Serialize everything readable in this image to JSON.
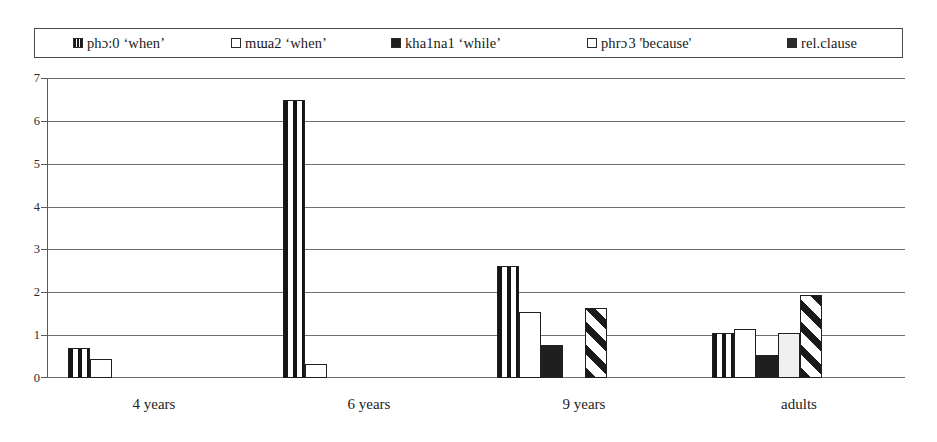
{
  "legend": {
    "items": [
      {
        "label": "phɔ:0  ‘when’",
        "swatch": "vertical-stripe-swatch",
        "style": "sw-vstripe"
      },
      {
        "label": "mɯa2 ‘when’",
        "swatch": "white-square-swatch",
        "style": "sw-white"
      },
      {
        "label": "kha1na1 ‘while’",
        "swatch": "black-square-swatch",
        "style": "sw-black"
      },
      {
        "label": "phrɔ 3 'because'",
        "swatch": "light-square-swatch",
        "style": "sw-lgray"
      },
      {
        "label": "rel.clause",
        "swatch": "dark-square-swatch",
        "style": "sw-dark"
      }
    ]
  },
  "axis": {
    "y_ticks": [
      "0",
      "1",
      "2",
      "3",
      "4",
      "5",
      "6",
      "7"
    ],
    "x_labels": [
      "4 years",
      "6 years",
      "9 years",
      "adults"
    ]
  },
  "chart_data": {
    "type": "bar",
    "title": "",
    "xlabel": "",
    "ylabel": "",
    "ylim": [
      0,
      7
    ],
    "grid": true,
    "legend_position": "top",
    "categories": [
      "4 years",
      "6 years",
      "9 years",
      "adults"
    ],
    "series": [
      {
        "name": "phɔ:0  ‘when’",
        "fill": "vertical-stripe",
        "values": [
          0.7,
          6.5,
          2.63,
          1.05
        ]
      },
      {
        "name": "mɯa2 ‘when’",
        "fill": "white",
        "values": [
          0.45,
          0.33,
          1.55,
          1.15
        ]
      },
      {
        "name": "kha1na1 ‘while’",
        "fill": "black",
        "values": [
          0,
          0,
          0.77,
          0.53
        ]
      },
      {
        "name": "phrɔ 3 'because'",
        "fill": "light-gray",
        "values": [
          0,
          0,
          0,
          1.05
        ]
      },
      {
        "name": "rel.clause",
        "fill": "diagonal-hatch",
        "values": [
          0,
          0,
          1.65,
          1.95
        ]
      }
    ]
  },
  "colors": {
    "ink": "#1a1a1a",
    "grid": "#6f6f6f",
    "axis": "#5a5a5a",
    "background": "#ffffff"
  }
}
